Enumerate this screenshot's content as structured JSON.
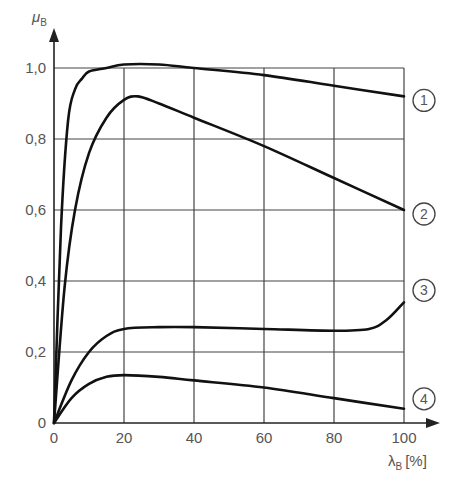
{
  "chart_data": {
    "type": "line",
    "title": "",
    "xlabel": "λ_B [%]",
    "ylabel": "μ_B",
    "xlim": [
      0,
      100
    ],
    "ylim": [
      0,
      1.0
    ],
    "x_ticks": [
      "0",
      "20",
      "40",
      "60",
      "80",
      "100"
    ],
    "y_ticks": [
      "0",
      "0,2",
      "0,4",
      "0,6",
      "0,8",
      "1,0"
    ],
    "grid": true,
    "legend_position": "right (circled numbers at line ends)",
    "series": [
      {
        "name": "1",
        "x": [
          0,
          2,
          4,
          6,
          8,
          10,
          15,
          20,
          30,
          40,
          60,
          80,
          100
        ],
        "y": [
          0,
          0.55,
          0.85,
          0.94,
          0.97,
          0.99,
          1.0,
          1.01,
          1.01,
          1.0,
          0.98,
          0.95,
          0.92
        ]
      },
      {
        "name": "2",
        "x": [
          0,
          3,
          6,
          10,
          15,
          20,
          24,
          30,
          40,
          60,
          80,
          100
        ],
        "y": [
          0,
          0.38,
          0.6,
          0.76,
          0.86,
          0.91,
          0.92,
          0.9,
          0.86,
          0.78,
          0.69,
          0.6
        ]
      },
      {
        "name": "3",
        "x": [
          0,
          5,
          10,
          15,
          20,
          30,
          40,
          60,
          80,
          90,
          95,
          100
        ],
        "y": [
          0,
          0.12,
          0.2,
          0.245,
          0.265,
          0.27,
          0.27,
          0.265,
          0.26,
          0.265,
          0.29,
          0.34
        ]
      },
      {
        "name": "4",
        "x": [
          0,
          5,
          10,
          15,
          20,
          30,
          40,
          60,
          80,
          100
        ],
        "y": [
          0,
          0.07,
          0.11,
          0.13,
          0.135,
          0.13,
          0.12,
          0.1,
          0.07,
          0.04
        ]
      }
    ]
  },
  "axes": {
    "y_label_main": "μ",
    "y_label_sub": "B",
    "x_label_main": "λ",
    "x_label_sub": "B",
    "x_label_unit": "[%]"
  },
  "markers": [
    "1",
    "2",
    "3",
    "4"
  ]
}
